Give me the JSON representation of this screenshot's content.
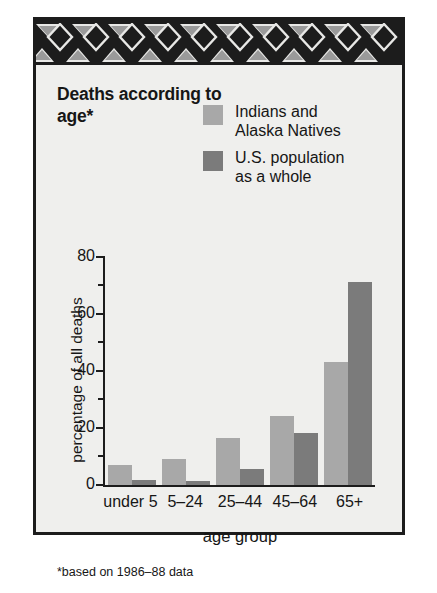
{
  "figure": {
    "title": "Deaths according\nto age*",
    "footnote": "*based on 1986–88 data",
    "ornament_name": "southwestern-triangle-band"
  },
  "legend": {
    "position": "top-right",
    "entries": [
      {
        "label": "Indians and\nAlaska Natives",
        "color": "#a8a8a8",
        "key": "series-a"
      },
      {
        "label": "U.S. population\nas a whole",
        "color": "#7b7b7b",
        "key": "series-b"
      }
    ]
  },
  "axes": {
    "y_title": "percentage of all deaths",
    "x_title": "age group",
    "y_major_ticks": [
      "0",
      "20",
      "40",
      "60",
      "80"
    ],
    "y_minor_ticks": [
      10,
      30,
      50,
      70
    ]
  },
  "chart_data": {
    "type": "bar",
    "title": "Deaths according to age*",
    "subtitle": "*based on 1986–88 data",
    "xlabel": "age group",
    "ylabel": "percentage of all deaths",
    "ylim": [
      0,
      80
    ],
    "yticks": [
      0,
      20,
      40,
      60,
      80
    ],
    "yminor": [
      10,
      30,
      50,
      70
    ],
    "grid": false,
    "legend_position": "top-right",
    "categories": [
      "under 5",
      "5–24",
      "25–44",
      "45–64",
      "65+"
    ],
    "series": [
      {
        "name": "Indians and Alaska Natives",
        "color": "#a8a8a8",
        "values": [
          7,
          9,
          16.5,
          24,
          43
        ]
      },
      {
        "name": "U.S. population as a whole",
        "color": "#7b7b7b",
        "values": [
          1.8,
          1.5,
          5.5,
          18,
          71
        ]
      }
    ]
  },
  "colors": {
    "frame": "#1c1c1c",
    "panel": "#efefed",
    "ornament_dark": "#1c1c1c",
    "ornament_light": "#e8e8e6",
    "ornament_mid": "#9a9a9a",
    "series_a": "#a8a8a8",
    "series_b": "#7b7b7b"
  }
}
